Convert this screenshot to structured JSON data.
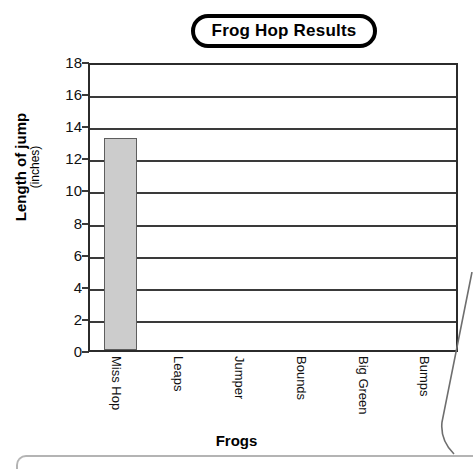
{
  "chart_data": {
    "type": "bar",
    "title": "Frog Hop Results",
    "xlabel": "Frogs",
    "ylabel": "Length of jump",
    "ylabel_units": "(inches)",
    "categories": [
      "Miss Hop",
      "Leaps",
      "Jumper",
      "Bounds",
      "Big Green",
      "Bumps"
    ],
    "values": [
      13.2,
      0,
      0,
      0,
      0,
      0
    ],
    "ylim": [
      0,
      18
    ],
    "ytick_step": 2,
    "yticks": [
      18,
      16,
      14,
      12,
      10,
      8,
      6,
      4,
      2,
      0
    ],
    "grid": "horizontal",
    "legend": "none",
    "bar_color": "#cccccc",
    "bar_border_color": "#5e5e5e",
    "axis_color": "#2b2b2b"
  },
  "title_badge": {
    "label": "Frog Hop Results"
  }
}
